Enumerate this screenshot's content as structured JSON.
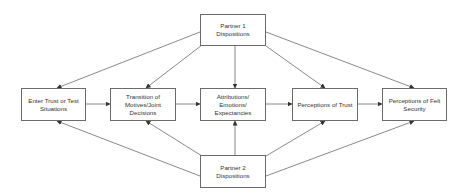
{
  "diagram": {
    "nodes": [
      {
        "id": "p1",
        "label": "Partner 1 Dispositions",
        "x": 200,
        "y": 14,
        "w": 66,
        "h": 32
      },
      {
        "id": "enter",
        "label": "Enter Trust or Test Situations",
        "x": 21,
        "y": 88,
        "w": 65,
        "h": 33
      },
      {
        "id": "trans",
        "label": "Transition of Motives/Joint Decisions",
        "x": 110,
        "y": 88,
        "w": 66,
        "h": 33
      },
      {
        "id": "attr",
        "label": "Attributions/ Emotions/ Expectancies",
        "x": 200,
        "y": 88,
        "w": 66,
        "h": 33
      },
      {
        "id": "trust",
        "label": "Perceptions of Trust",
        "x": 292,
        "y": 88,
        "w": 66,
        "h": 33
      },
      {
        "id": "felt",
        "label": "Perceptions of Felt Security",
        "x": 382,
        "y": 88,
        "w": 65,
        "h": 33
      },
      {
        "id": "p2",
        "label": "Partner 2 Dispositions",
        "x": 200,
        "y": 155,
        "w": 66,
        "h": 33
      }
    ],
    "edges": [
      {
        "from": "enter",
        "to": "trans"
      },
      {
        "from": "trans",
        "to": "attr"
      },
      {
        "from": "attr",
        "to": "trust"
      },
      {
        "from": "trust",
        "to": "felt"
      },
      {
        "from": "p1",
        "to": "enter"
      },
      {
        "from": "p1",
        "to": "trans"
      },
      {
        "from": "p1",
        "to": "attr"
      },
      {
        "from": "p1",
        "to": "trust"
      },
      {
        "from": "p1",
        "to": "felt"
      },
      {
        "from": "p2",
        "to": "enter"
      },
      {
        "from": "p2",
        "to": "trans"
      },
      {
        "from": "p2",
        "to": "attr"
      },
      {
        "from": "p2",
        "to": "trust"
      },
      {
        "from": "p2",
        "to": "felt"
      }
    ],
    "colors": {
      "line": "#6b6b6b",
      "text": "#333333",
      "border": "#6b6b6b"
    }
  }
}
